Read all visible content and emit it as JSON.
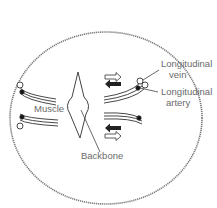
{
  "diagram": {
    "type": "fish cross-section",
    "labels": {
      "longitudinal_vein": [
        "Longitudinal",
        "vein"
      ],
      "longitudinal_artery": [
        "Longitudinal",
        "artery"
      ],
      "muscle": "Muscle",
      "backbone": "Backbone"
    },
    "arrows": {
      "upper_right": [
        "outline-right",
        "solid-left"
      ],
      "lower_right": [
        "solid-left",
        "outline-right"
      ]
    },
    "colors": {
      "outline": "#555555",
      "text": "#6a6a6a",
      "solid_arrow": "#222222"
    }
  }
}
